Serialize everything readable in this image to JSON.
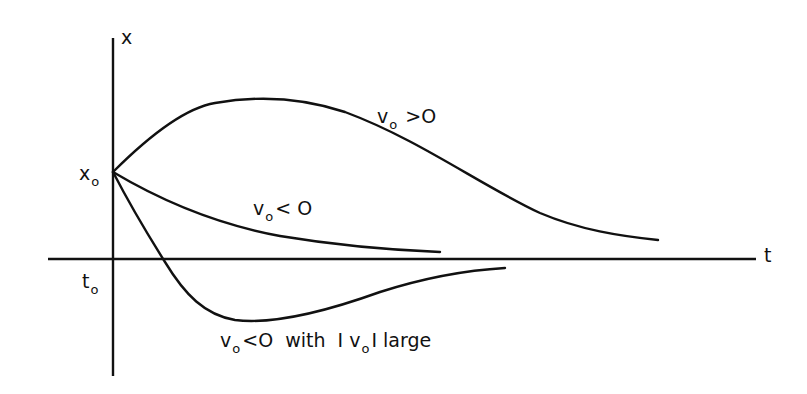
{
  "diagram": {
    "axes": {
      "vertical_label": "x",
      "horizontal_label": "t",
      "origin_time_label": {
        "base": "t",
        "sub": "o"
      },
      "initial_position_label": {
        "base": "x",
        "sub": "o"
      }
    },
    "curves": [
      {
        "id": "positive-velocity",
        "label": {
          "pre": "v",
          "sub": "o",
          "post": " >O"
        },
        "description": "rises from x0 to a maximum then decays toward the t-axis"
      },
      {
        "id": "negative-velocity",
        "label": {
          "pre": "v",
          "sub": "o",
          "post": "< O"
        },
        "description": "decays monotonically from x0 toward the t-axis"
      },
      {
        "id": "negative-velocity-large",
        "label": {
          "pre": "v",
          "sub": "o",
          "post": "<O  with  I v",
          "sub2": "o",
          "post2": "I large"
        },
        "description": "overshoots below the t-axis, reaches a minimum, then returns toward the axis"
      }
    ],
    "colors": {
      "ink": "#111111",
      "background": "#ffffff"
    }
  }
}
